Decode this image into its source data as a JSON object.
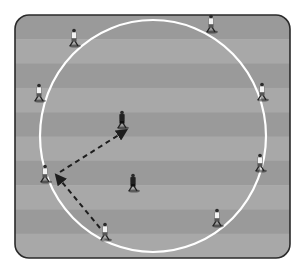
{
  "diagram": {
    "title": "",
    "type": "soccer-drill",
    "field": {
      "x": 15,
      "y": 15,
      "width": 275,
      "height": 243,
      "corner_radius": 14,
      "border_color": "#2a2a2a",
      "stripe_colors": [
        "#9a9a9a",
        "#a8a8a8"
      ],
      "stripe_count": 10
    },
    "circle": {
      "cx": 153,
      "cy": 136,
      "rx": 113,
      "ry": 116,
      "color": "#ffffff"
    },
    "players": [
      {
        "id": "w1",
        "team": "light",
        "x": 74,
        "y": 38
      },
      {
        "id": "w2",
        "team": "light",
        "x": 211,
        "y": 24
      },
      {
        "id": "w3",
        "team": "light",
        "x": 39,
        "y": 93
      },
      {
        "id": "w4",
        "team": "light",
        "x": 262,
        "y": 92
      },
      {
        "id": "w5",
        "team": "light",
        "x": 260,
        "y": 163
      },
      {
        "id": "w6",
        "team": "light",
        "x": 45,
        "y": 174
      },
      {
        "id": "w7",
        "team": "light",
        "x": 105,
        "y": 232
      },
      {
        "id": "w8",
        "team": "light",
        "x": 217,
        "y": 218
      },
      {
        "id": "d1",
        "team": "dark",
        "x": 122,
        "y": 120
      },
      {
        "id": "d2",
        "team": "dark",
        "x": 133,
        "y": 183
      }
    ],
    "arrows": [
      {
        "id": "pass-1",
        "style": "dashed",
        "from": [
          100,
          228
        ],
        "to": [
          57,
          176
        ]
      },
      {
        "id": "pass-2",
        "style": "dashed",
        "from": [
          60,
          172
        ],
        "to": [
          125,
          131
        ]
      }
    ],
    "colors": {
      "light_shirt": "#f2f2f2",
      "dark_shirt": "#222222",
      "arrow": "#1e1e1e"
    }
  }
}
